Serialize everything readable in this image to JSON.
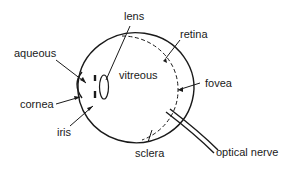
{
  "diagram": {
    "labels": {
      "lens": "lens",
      "retina": "retina",
      "aqueous": "aqueous",
      "vitreous": "vitreous",
      "fovea": "fovea",
      "cornea": "cornea",
      "iris": "iris",
      "sclera": "sclera",
      "optical_nerve": "optical nerve"
    },
    "colors": {
      "ink": "#1a1a1a",
      "background": "#ffffff"
    }
  }
}
